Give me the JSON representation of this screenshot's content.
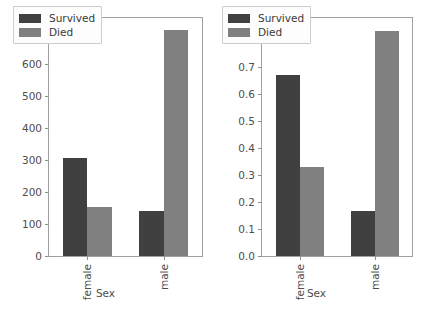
{
  "figure": {
    "background_color": "#ffffff",
    "panel_count": 2
  },
  "colors": {
    "survived": "#404040",
    "died": "#808080",
    "axis": "#a0a0a0",
    "text": "#4d4d4d"
  },
  "legend": {
    "entries": [
      {
        "label": "Survived",
        "color": "#404040",
        "key": "survived"
      },
      {
        "label": "Died",
        "color": "#808080",
        "key": "died"
      }
    ]
  },
  "chart_data": [
    {
      "type": "bar",
      "id": "counts",
      "title": "",
      "xlabel": "Sex",
      "ylabel": "",
      "categories": [
        "female",
        "male"
      ],
      "xtick_labels": [
        "female",
        "male"
      ],
      "ytick_labels": [
        "0",
        "100",
        "200",
        "300",
        "400",
        "500",
        "600",
        "700"
      ],
      "ytick_values": [
        0,
        100,
        200,
        300,
        400,
        500,
        600,
        700
      ],
      "ylim": [
        0,
        745
      ],
      "grid": false,
      "legend_position": "upper left",
      "series": [
        {
          "name": "Survived",
          "color": "#404040",
          "values": [
            307,
            142
          ]
        },
        {
          "name": "Died",
          "color": "#808080",
          "values": [
            154,
            707
          ]
        }
      ]
    },
    {
      "type": "bar",
      "id": "proportions",
      "title": "",
      "xlabel": "Sex",
      "ylabel": "",
      "categories": [
        "female",
        "male"
      ],
      "xtick_labels": [
        "female",
        "male"
      ],
      "ytick_labels": [
        "0.0",
        "0.1",
        "0.2",
        "0.3",
        "0.4",
        "0.5",
        "0.6",
        "0.7",
        "0.8"
      ],
      "ytick_values": [
        0.0,
        0.1,
        0.2,
        0.3,
        0.4,
        0.5,
        0.6,
        0.7,
        0.8
      ],
      "ylim": [
        0,
        0.882
      ],
      "grid": false,
      "legend_position": "upper left",
      "series": [
        {
          "name": "Survived",
          "color": "#404040",
          "values": [
            0.67,
            0.165
          ]
        },
        {
          "name": "Died",
          "color": "#808080",
          "values": [
            0.33,
            0.835
          ]
        }
      ]
    }
  ]
}
